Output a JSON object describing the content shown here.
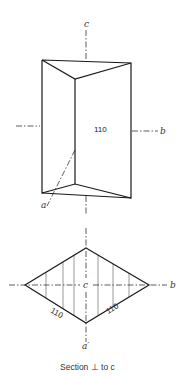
{
  "figure": {
    "prism": {
      "axis_c_label": "c",
      "axis_b_label": "b",
      "axis_a_label": "a",
      "face_label": "110"
    },
    "section": {
      "center_label": "c",
      "axis_b_label": "b",
      "axis_a_label": "a′",
      "face_left_label": "110",
      "face_right_label": "110",
      "caption": "Section ⊥ to c"
    }
  }
}
